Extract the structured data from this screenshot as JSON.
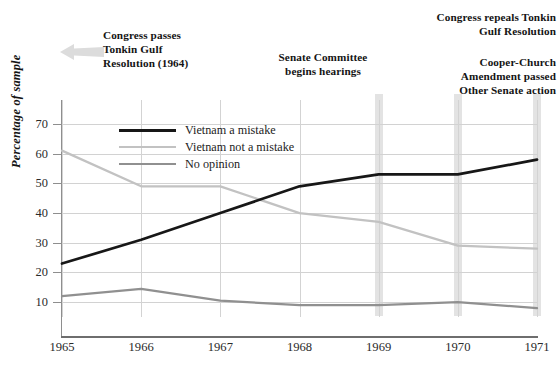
{
  "chart_data": {
    "type": "line",
    "title": "",
    "xlabel": "",
    "ylabel": "Percentage of sample",
    "x": [
      1965,
      1966,
      1967,
      1968,
      1969,
      1970,
      1971
    ],
    "categories": [
      "1965",
      "1966",
      "1967",
      "1968",
      "1969",
      "1970",
      "1971"
    ],
    "xlim": [
      1965,
      1971
    ],
    "ylim": [
      5,
      72
    ],
    "yticks": [
      10,
      20,
      30,
      40,
      50,
      60,
      70
    ],
    "ytick_labels": [
      "10",
      "20",
      "30",
      "40",
      "50",
      "60",
      "70"
    ],
    "grid": true,
    "legend_position": "upper-left-inside",
    "series": [
      {
        "name": "Vietnam a mistake",
        "color": "#171717",
        "width": 2.7,
        "values": [
          23,
          31,
          40,
          49,
          53,
          53,
          58
        ]
      },
      {
        "name": "Vietnam not a mistake",
        "color": "#c2c2c2",
        "width": 2.3,
        "values": [
          61,
          49,
          49,
          40,
          37,
          29,
          28
        ]
      },
      {
        "name": "No opinion",
        "color": "#909090",
        "width": 2.3,
        "values": [
          12,
          14.5,
          10.5,
          9,
          9,
          10,
          8
        ]
      }
    ],
    "annotations": [
      {
        "name": "tonkin-gulf-resolution",
        "text": "Congress passes\nTonkin Gulf\nResolution (1964)",
        "marker": "left-arrow"
      },
      {
        "name": "senate-committee-hearings",
        "text": "Senate Committee\nbegins hearings",
        "event_x": 1969,
        "marker": "vertical-band"
      },
      {
        "name": "congress-repeals-tonkin",
        "text": "Congress repeals Tonkin\nGulf Resolution",
        "event_x": 1969,
        "marker": "vertical-band"
      },
      {
        "name": "cooper-church-amendment",
        "text": "Cooper-Church\nAmendment passed\nOther Senate action",
        "event_x": 1970,
        "marker": "vertical-band"
      }
    ],
    "event_bands": [
      {
        "name": "event-band-1969",
        "x": 1969,
        "color": "#dedede"
      },
      {
        "name": "event-band-1970",
        "x": 1970,
        "color": "#dedede"
      },
      {
        "name": "event-band-1971",
        "x": 1971,
        "color": "#dedede"
      }
    ]
  },
  "axes": {
    "y_title": "Percentage of sample",
    "y_ticks": [
      "70",
      "60",
      "50",
      "40",
      "30",
      "20",
      "10"
    ],
    "x_ticks": [
      "1965",
      "1966",
      "1967",
      "1968",
      "1969",
      "1970",
      "1971"
    ]
  },
  "legend": {
    "items": [
      {
        "label": "Vietnam a mistake",
        "color": "#171717"
      },
      {
        "label": "Vietnam not a mistake",
        "color": "#c2c2c2"
      },
      {
        "label": "No opinion",
        "color": "#909090"
      }
    ]
  },
  "annotations": {
    "tonkin_pass": "Congress passes\nTonkin Gulf\nResolution (1964)",
    "senate_hearings": "Senate Committee\nbegins hearings",
    "congress_repeals": "Congress repeals Tonkin\nGulf Resolution",
    "cooper_church": "Cooper-Church\nAmendment passed\nOther Senate action"
  },
  "colors": {
    "mistake": "#171717",
    "not_mistake": "#c2c2c2",
    "no_opinion": "#909090",
    "grid": "#d2d2d2",
    "axis": "#8e8e8e",
    "band": "#dedede",
    "arrow": "#d8d8d8"
  }
}
